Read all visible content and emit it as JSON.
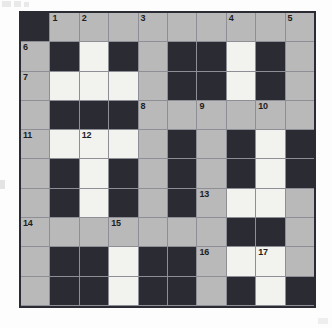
{
  "document": {
    "type": "crossword-grid",
    "title": "Crossword Puzzle Grid",
    "size": {
      "columns": 10,
      "rows": 10
    }
  },
  "colors": {
    "blocked_cell": "#2b2b33",
    "open_cell": "#b9b9b9",
    "filled_cell": "#f2f2ee",
    "grid_line": "#8e8e96",
    "border": "#2b2b33",
    "number_text": "#1d1d22",
    "page_background": "#fdfdfd"
  },
  "legend": {
    "blocked": "black square",
    "open": "gray square",
    "filled": "white square"
  },
  "grid": {
    "rows": [
      [
        {
          "state": "black",
          "num": ""
        },
        {
          "state": "gray",
          "num": "1"
        },
        {
          "state": "gray",
          "num": "2"
        },
        {
          "state": "gray",
          "num": ""
        },
        {
          "state": "gray",
          "num": "3"
        },
        {
          "state": "gray",
          "num": ""
        },
        {
          "state": "gray",
          "num": ""
        },
        {
          "state": "gray",
          "num": "4"
        },
        {
          "state": "gray",
          "num": ""
        },
        {
          "state": "gray",
          "num": "5"
        }
      ],
      [
        {
          "state": "gray",
          "num": "6"
        },
        {
          "state": "black",
          "num": ""
        },
        {
          "state": "white",
          "num": ""
        },
        {
          "state": "black",
          "num": ""
        },
        {
          "state": "gray",
          "num": ""
        },
        {
          "state": "black",
          "num": ""
        },
        {
          "state": "black",
          "num": ""
        },
        {
          "state": "white",
          "num": ""
        },
        {
          "state": "black",
          "num": ""
        },
        {
          "state": "gray",
          "num": ""
        }
      ],
      [
        {
          "state": "gray",
          "num": "7"
        },
        {
          "state": "white",
          "num": ""
        },
        {
          "state": "white",
          "num": ""
        },
        {
          "state": "white",
          "num": ""
        },
        {
          "state": "gray",
          "num": ""
        },
        {
          "state": "black",
          "num": ""
        },
        {
          "state": "black",
          "num": ""
        },
        {
          "state": "white",
          "num": ""
        },
        {
          "state": "black",
          "num": ""
        },
        {
          "state": "gray",
          "num": ""
        }
      ],
      [
        {
          "state": "gray",
          "num": ""
        },
        {
          "state": "black",
          "num": ""
        },
        {
          "state": "black",
          "num": ""
        },
        {
          "state": "black",
          "num": ""
        },
        {
          "state": "gray",
          "num": "8"
        },
        {
          "state": "gray",
          "num": ""
        },
        {
          "state": "gray",
          "num": "9"
        },
        {
          "state": "gray",
          "num": ""
        },
        {
          "state": "gray",
          "num": "10"
        },
        {
          "state": "gray",
          "num": ""
        }
      ],
      [
        {
          "state": "gray",
          "num": "11"
        },
        {
          "state": "white",
          "num": ""
        },
        {
          "state": "white",
          "num": "12"
        },
        {
          "state": "white",
          "num": ""
        },
        {
          "state": "gray",
          "num": ""
        },
        {
          "state": "black",
          "num": ""
        },
        {
          "state": "gray",
          "num": ""
        },
        {
          "state": "black",
          "num": ""
        },
        {
          "state": "white",
          "num": ""
        },
        {
          "state": "black",
          "num": ""
        }
      ],
      [
        {
          "state": "gray",
          "num": ""
        },
        {
          "state": "black",
          "num": ""
        },
        {
          "state": "white",
          "num": ""
        },
        {
          "state": "black",
          "num": ""
        },
        {
          "state": "gray",
          "num": ""
        },
        {
          "state": "black",
          "num": ""
        },
        {
          "state": "gray",
          "num": ""
        },
        {
          "state": "black",
          "num": ""
        },
        {
          "state": "white",
          "num": ""
        },
        {
          "state": "black",
          "num": ""
        }
      ],
      [
        {
          "state": "gray",
          "num": ""
        },
        {
          "state": "black",
          "num": ""
        },
        {
          "state": "white",
          "num": ""
        },
        {
          "state": "black",
          "num": ""
        },
        {
          "state": "gray",
          "num": ""
        },
        {
          "state": "black",
          "num": ""
        },
        {
          "state": "gray",
          "num": "13"
        },
        {
          "state": "white",
          "num": ""
        },
        {
          "state": "white",
          "num": ""
        },
        {
          "state": "gray",
          "num": ""
        }
      ],
      [
        {
          "state": "gray",
          "num": "14"
        },
        {
          "state": "gray",
          "num": ""
        },
        {
          "state": "gray",
          "num": ""
        },
        {
          "state": "gray",
          "num": "15"
        },
        {
          "state": "gray",
          "num": ""
        },
        {
          "state": "gray",
          "num": ""
        },
        {
          "state": "gray",
          "num": ""
        },
        {
          "state": "black",
          "num": ""
        },
        {
          "state": "black",
          "num": ""
        },
        {
          "state": "gray",
          "num": ""
        }
      ],
      [
        {
          "state": "gray",
          "num": ""
        },
        {
          "state": "black",
          "num": ""
        },
        {
          "state": "black",
          "num": ""
        },
        {
          "state": "white",
          "num": ""
        },
        {
          "state": "black",
          "num": ""
        },
        {
          "state": "black",
          "num": ""
        },
        {
          "state": "gray",
          "num": "16"
        },
        {
          "state": "white",
          "num": ""
        },
        {
          "state": "white",
          "num": "17"
        },
        {
          "state": "gray",
          "num": ""
        }
      ],
      [
        {
          "state": "gray",
          "num": ""
        },
        {
          "state": "black",
          "num": ""
        },
        {
          "state": "black",
          "num": ""
        },
        {
          "state": "white",
          "num": ""
        },
        {
          "state": "black",
          "num": ""
        },
        {
          "state": "black",
          "num": ""
        },
        {
          "state": "gray",
          "num": ""
        },
        {
          "state": "black",
          "num": ""
        },
        {
          "state": "white",
          "num": ""
        },
        {
          "state": "black",
          "num": ""
        }
      ],
      [
        {
          "state": "gray",
          "num": "18"
        },
        {
          "state": "gray",
          "num": ""
        },
        {
          "state": "gray",
          "num": ""
        },
        {
          "state": "gray",
          "num": ""
        },
        {
          "state": "gray",
          "num": ""
        },
        {
          "state": "gray",
          "num": ""
        },
        {
          "state": "gray",
          "num": ""
        },
        {
          "state": "gray",
          "num": ""
        },
        {
          "state": "gray",
          "num": ""
        },
        {
          "state": "black",
          "num": ""
        }
      ]
    ]
  },
  "clue_numbers": [
    "1",
    "2",
    "3",
    "4",
    "5",
    "6",
    "7",
    "8",
    "9",
    "10",
    "11",
    "12",
    "13",
    "14",
    "15",
    "16",
    "17",
    "18"
  ]
}
